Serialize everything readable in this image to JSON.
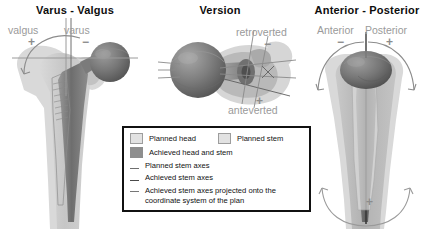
{
  "figure": {
    "type": "medical-illustration",
    "background_color": "#ffffff"
  },
  "panels": [
    {
      "id": "varus-valgus",
      "title": "Varus - Valgus",
      "view": "coronal",
      "direction_labels": [
        {
          "text": "valgus",
          "sign": "+"
        },
        {
          "text": "varus",
          "sign": "−"
        }
      ]
    },
    {
      "id": "version",
      "title": "Version",
      "view": "axial",
      "direction_labels": [
        {
          "text": "retroverted",
          "sign": "−"
        },
        {
          "text": "anteverted",
          "sign": "+"
        }
      ]
    },
    {
      "id": "anterior-posterior",
      "title": "Anterior - Posterior",
      "view": "sagittal",
      "direction_labels": [
        {
          "text": "Anterior",
          "sign": "−"
        },
        {
          "text": "Posterior",
          "sign": "+"
        }
      ],
      "bottom_sign": "+"
    }
  ],
  "legend": {
    "border_color": "#111111",
    "swatch_entries": [
      {
        "label": "Planned head",
        "color": "#e2e2e2",
        "style": "outlined"
      },
      {
        "label": "Planned stem",
        "color": "#e2e2e2",
        "style": "outlined"
      },
      {
        "label": "Achieved head and stem",
        "color": "#8e8e8e",
        "style": "filled"
      }
    ],
    "line_entries": [
      {
        "label": "Planned stem axes",
        "color": "#6f6f6f"
      },
      {
        "label": "Achieved stem axes",
        "color": "#4a4a4a"
      },
      {
        "label": "Achieved stem axes projected onto the coordinate system of the plan",
        "color": "#777777"
      }
    ]
  },
  "colors": {
    "planned_fill": "#d2d2d2",
    "planned_light": "#e2e2e2",
    "achieved_fill": "#8e8e8e",
    "bone_light": "#cfcfcf",
    "bone_mid": "#b4b4b4",
    "head_dark": "#6b6b6b",
    "axis_gray": "#9a9a9a",
    "text_dark": "#0d0d0d",
    "label_gray": "#9a9a9a"
  }
}
